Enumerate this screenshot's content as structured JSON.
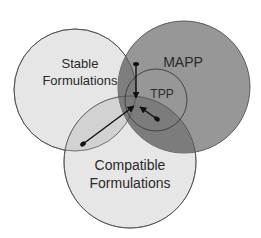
{
  "diagram": {
    "type": "venn",
    "sets": [
      {
        "id": "stable",
        "label_lines": [
          "Stable",
          "Formulations"
        ],
        "fill": "#e4e4e4"
      },
      {
        "id": "mapp",
        "label_lines": [
          "MAPP"
        ],
        "fill": "#8c8c8c"
      },
      {
        "id": "compatible",
        "label_lines": [
          "Compatible",
          "Formulations"
        ],
        "fill": "#dcdcdc"
      },
      {
        "id": "tpp",
        "label_lines": [
          "TPP"
        ],
        "fill": "#7a7a7a"
      }
    ],
    "arrows": [
      {
        "from": "MAPP ∩ Stable",
        "to": "TPP center"
      },
      {
        "from": "Stable ∩ Compatible",
        "to": "TPP center"
      },
      {
        "from": "TPP ∩ MAPP ∩ Compatible",
        "to": "TPP center"
      }
    ],
    "colors": {
      "outline": "#3a3a3a",
      "arrow": "#111111",
      "text": "#2a2a2a"
    }
  }
}
